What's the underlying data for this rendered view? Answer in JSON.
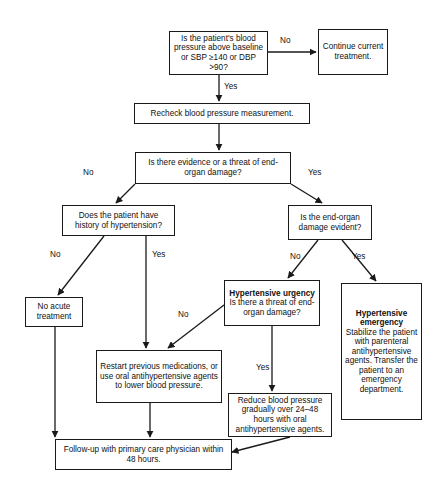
{
  "figure": {
    "type": "flowchart",
    "orientation": "top-down",
    "background": "#ffffff",
    "line_color": "#1a1a1a",
    "text_color": "#111111"
  },
  "nodes": {
    "start_question": "Is the patient's blood pressure above baseline or SBP ≥140 or DBP >90?",
    "continue_treatment": "Continue current treatment.",
    "recheck": "Recheck blood pressure measurement.",
    "evidence_question": "Is there evidence or a threat of end-organ damage?",
    "history_question": "Does the patient have history of hypertension?",
    "endorgan_question": "Is the end-organ damage evident?",
    "no_acute": "No acute treatment",
    "urgency_title": "Hypertensive urgency",
    "urgency_body": "Is there a threat of end-organ damage?",
    "emergency_title": "Hypertensive emergency",
    "emergency_body": "Stabilize the patient with parenteral antihypertensive agents. Transfer the patient to an emergency department.",
    "restart_meds": "Restart previous medications, or use oral antihypertensive agents to lower blood pressure.",
    "reduce_bp": "Reduce blood pressure gradually over 24–48 hours with oral antihypertensive agents.",
    "followup": "Follow-up with primary care physician within 48 hours."
  },
  "edge_labels": {
    "start_no": "No",
    "start_yes": "Yes",
    "evidence_no": "No",
    "evidence_yes": "Yes",
    "history_no": "No",
    "history_yes": "Yes",
    "endorgan_no": "No",
    "endorgan_yes": "Yes",
    "urgency_no": "No",
    "urgency_yes": "Yes"
  }
}
